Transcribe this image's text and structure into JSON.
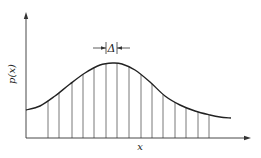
{
  "diagram": {
    "title": "",
    "y_axis_label": "p(x)",
    "x_axis_label": "x",
    "interval_label": "Δ",
    "colors": {
      "line": "#333333",
      "background": "#ffffff"
    },
    "curve": [
      [
        26,
        110
      ],
      [
        40,
        106
      ],
      [
        55,
        96
      ],
      [
        70,
        84
      ],
      [
        85,
        73
      ],
      [
        100,
        65
      ],
      [
        113,
        63
      ],
      [
        122,
        64
      ],
      [
        135,
        70
      ],
      [
        150,
        82
      ],
      [
        165,
        96
      ],
      [
        180,
        105
      ],
      [
        195,
        111
      ],
      [
        210,
        115
      ],
      [
        220,
        117
      ],
      [
        231,
        118
      ]
    ],
    "bins_x": [
      48,
      59,
      72,
      83,
      94,
      106,
      117,
      129,
      141,
      152,
      163,
      175,
      186,
      198,
      209
    ],
    "axis": {
      "origin": [
        26,
        138
      ],
      "x_end": 251,
      "y_top": 12
    },
    "delta_bracket": {
      "left": 106,
      "right": 117,
      "y": 48
    }
  }
}
